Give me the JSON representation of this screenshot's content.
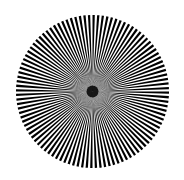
{
  "figure": {
    "type": "siemens-star",
    "background_color": "#ffffff",
    "spoke_color": "#000000",
    "gap_color": "#ffffff",
    "center_x": 92.5,
    "center_y": 91.5,
    "radius": 76.5,
    "black_spokes": 104,
    "icon": "siemens-star-test-pattern"
  }
}
